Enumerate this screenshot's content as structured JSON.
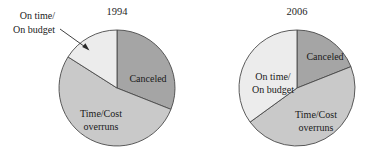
{
  "figure": {
    "title": "",
    "background_color": "#ffffff",
    "width": 378,
    "height": 165
  },
  "colors": {
    "canceled": "#a5a5a5",
    "time_cost_overruns": "#c9c9c9",
    "on_time_on_budget": "#ececec",
    "slice_outline": "#4a4a4a",
    "text": "#1a1a1a",
    "leader_line": "#2b2b2b"
  },
  "chart_data": [
    {
      "type": "pie",
      "title": "1994",
      "xlabel": "",
      "ylabel": "",
      "legend_position": "none",
      "grid": false,
      "categories": [
        "Canceled",
        "Time/Cost overruns",
        "On time/On budget"
      ],
      "values": [
        31,
        53,
        16
      ],
      "labels": [
        "Canceled",
        "Time/Cost overruns",
        "On time/On budget"
      ],
      "label_placement": [
        "inside",
        "inside",
        "callout"
      ],
      "start_angle_deg": 90,
      "direction": "clockwise"
    },
    {
      "type": "pie",
      "title": "2006",
      "xlabel": "",
      "ylabel": "",
      "legend_position": "none",
      "grid": false,
      "categories": [
        "Canceled",
        "Time/Cost overruns",
        "On time/On budget"
      ],
      "values": [
        19,
        46,
        35
      ],
      "labels": [
        "Canceled",
        "Time/Cost overruns",
        "On time/On budget"
      ],
      "label_placement": [
        "inside",
        "inside",
        "inside"
      ],
      "start_angle_deg": 90,
      "direction": "clockwise"
    }
  ],
  "charts": [
    {
      "id": "pie-1994",
      "year": "1994",
      "center": {
        "x": 117,
        "y": 88
      },
      "radius": 58,
      "labels": {
        "canceled": "Canceled",
        "overruns_line1": "Time/Cost",
        "overruns_line2": "overruns",
        "ontime_line1": "On time/",
        "ontime_line2": "On budget"
      }
    },
    {
      "id": "pie-2006",
      "year": "2006",
      "center": {
        "x": 297,
        "y": 88
      },
      "radius": 58,
      "labels": {
        "canceled": "Canceled",
        "overruns_line1": "Time/Cost",
        "overruns_line2": "overruns",
        "ontime_line1": "On time/",
        "ontime_line2": "On budget"
      }
    }
  ]
}
